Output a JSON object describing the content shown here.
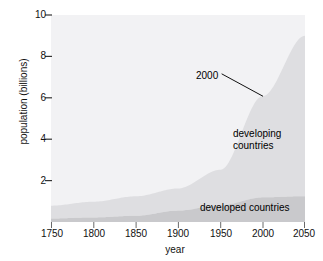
{
  "chart_data": {
    "type": "area",
    "stacked": true,
    "title": "",
    "xlabel": "year",
    "ylabel": "population (billions)",
    "xlim": [
      1750,
      2050
    ],
    "ylim": [
      0,
      10
    ],
    "xticks": [
      1750,
      1800,
      1850,
      1900,
      1950,
      2000,
      2050
    ],
    "yticks": [
      2,
      4,
      6,
      8,
      10
    ],
    "grid": false,
    "legend": "inline-annotations",
    "x": [
      1750,
      1800,
      1850,
      1900,
      1950,
      2000,
      2050
    ],
    "series": [
      {
        "name": "developed countries",
        "color": "#c9c9cc",
        "values": [
          0.17,
          0.22,
          0.3,
          0.55,
          0.81,
          1.19,
          1.25
        ]
      },
      {
        "name": "developing countries",
        "color": "#dedee1",
        "values": [
          0.62,
          0.76,
          0.94,
          1.07,
          1.71,
          4.89,
          7.75
        ]
      }
    ],
    "totals": [
      0.79,
      0.98,
      1.24,
      1.62,
      2.52,
      6.08,
      9.0
    ],
    "annotations": [
      {
        "text": "2000",
        "x": 2000,
        "y": 6.08,
        "leader": true
      },
      {
        "text": "developing countries",
        "x": 2010,
        "y": 4.4,
        "leader": false
      },
      {
        "text": "developed countries",
        "x": 1995,
        "y": 0.6,
        "leader": false
      }
    ]
  },
  "axes": {
    "ylabel": "population (billions)",
    "xlabel": "year",
    "ytick_labels": [
      "10",
      "8",
      "6",
      "4",
      "2"
    ],
    "xtick_labels": [
      "1750",
      "1800",
      "1850",
      "1900",
      "1950",
      "2000",
      "2050"
    ]
  },
  "annotations": {
    "year_callout": "2000",
    "developing_line1": "developing",
    "developing_line2": "countries",
    "developed": "developed countries"
  },
  "artifacts": {
    "top_clipped_text": "",
    "bottom_clipped_text": ""
  },
  "colors": {
    "plot_background": "#f2f2f4",
    "developing_band": "#dedee1",
    "developed_band": "#c9c9cc",
    "text": "#111111",
    "leader_line": "#111111"
  }
}
